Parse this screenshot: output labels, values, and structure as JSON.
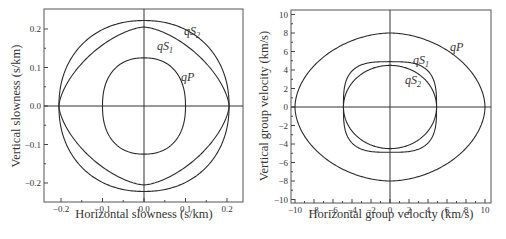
{
  "chart_data": [
    {
      "type": "line",
      "title": "",
      "xlabel": "Horizontal slowness (s/km)",
      "ylabel": "Vertical slowness (s/km)",
      "xlim": [
        -0.25,
        0.25
      ],
      "ylim": [
        -0.25,
        0.25
      ],
      "xticks": [
        -0.2,
        -0.1,
        0.0,
        0.1,
        0.2
      ],
      "xtick_labels": [
        "−0.2",
        "−0.1",
        "0.0",
        "0.1",
        "0.2"
      ],
      "yticks": [
        -0.2,
        -0.1,
        0.0,
        0.1,
        0.2
      ],
      "ytick_labels": [
        "−0.2",
        "−0.1",
        "0.0",
        "0.1",
        "0.2"
      ],
      "grid": false,
      "axes_through_origin": true,
      "series": [
        {
          "name": "qS2",
          "label_main": "qS",
          "label_sub": "2",
          "shape": "closed_curve",
          "x_radius": 0.205,
          "y_radius": 0.222,
          "exponent": 2.15
        },
        {
          "name": "qS1",
          "label_main": "qS",
          "label_sub": "1",
          "shape": "closed_curve",
          "x_radius": 0.205,
          "y_radius": 0.205,
          "exponent": 1.55
        },
        {
          "name": "qP",
          "label_main": "qP",
          "label_sub": "",
          "shape": "closed_curve",
          "x_radius": 0.1,
          "y_radius": 0.125,
          "exponent": 2.3
        }
      ]
    },
    {
      "type": "line",
      "title": "",
      "xlabel": "Horizontal group velocity (km/s)",
      "ylabel": "Vertical group velocity (km/s)",
      "xlim": [
        -10.5,
        10.5
      ],
      "ylim": [
        -10.5,
        10.5
      ],
      "xticks": [
        -10,
        -8,
        -6,
        -4,
        -2,
        0,
        2,
        4,
        6,
        8,
        10
      ],
      "xtick_labels": [
        "−10",
        "−8",
        "−6",
        "−4",
        "−2",
        "0",
        "2",
        "4",
        "6",
        "8",
        "10"
      ],
      "yticks": [
        -10,
        -8,
        -6,
        -4,
        -2,
        0,
        2,
        4,
        6,
        8,
        10
      ],
      "ytick_labels": [
        "−10",
        "−8",
        "−6",
        "−4",
        "−2",
        "0",
        "2",
        "4",
        "6",
        "8",
        "10"
      ],
      "grid": false,
      "axes_through_origin": true,
      "series": [
        {
          "name": "qP",
          "label_main": "qP",
          "label_sub": "",
          "shape": "closed_curve",
          "x_radius": 10.0,
          "y_radius": 8.0,
          "exponent": 1.85
        },
        {
          "name": "qS1",
          "label_main": "qS",
          "label_sub": "1",
          "shape": "closed_curve",
          "x_radius": 4.9,
          "y_radius": 4.9,
          "exponent": 3.2
        },
        {
          "name": "qS2",
          "label_main": "qS",
          "label_sub": "2",
          "shape": "closed_curve",
          "x_radius": 4.9,
          "y_radius": 4.5,
          "exponent": 2.0
        }
      ]
    }
  ],
  "labels": {
    "left": {
      "xlabel": "Horizontal slowness (s/km)",
      "ylabel": "Vertical slowness (s/km)",
      "qS2": {
        "main": "qS",
        "sub": "2"
      },
      "qS1": {
        "main": "qS",
        "sub": "1"
      },
      "qP": {
        "main": "qP"
      }
    },
    "right": {
      "xlabel": "Horizontal group velocity (km/s)",
      "ylabel": "Vertical group velocity (km/s)",
      "qP": {
        "main": "qP"
      },
      "qS1": {
        "main": "qS",
        "sub": "1"
      },
      "qS2": {
        "main": "qS",
        "sub": "2"
      }
    }
  },
  "layout": {
    "left": {
      "frame": [
        44,
        9,
        243,
        202
      ],
      "origin": [
        144,
        106
      ],
      "px_per_unit_x": 415,
      "px_per_unit_y": 385
    },
    "right": {
      "frame": [
        291,
        10,
        491,
        203
      ],
      "origin": [
        390,
        107
      ],
      "px_per_unit_x": 9.5,
      "px_per_unit_y": 9.25
    }
  }
}
